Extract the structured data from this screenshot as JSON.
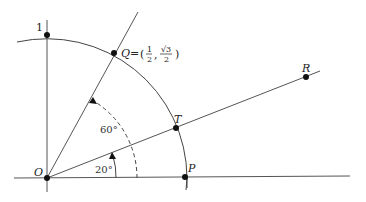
{
  "diagram": {
    "type": "unit-circle-rotation",
    "points": {
      "O": {
        "label": "O"
      },
      "P": {
        "label": "P"
      },
      "Q": {
        "label": "Q",
        "coord_prefix": "Q = (",
        "x_num": "1",
        "x_den": "2",
        "y_num": "√3",
        "y_den": "2",
        "coord_suffix": ")"
      },
      "T": {
        "label": "T"
      },
      "R": {
        "label": "R"
      },
      "one": {
        "label": "1"
      }
    },
    "angles": {
      "small": {
        "label": "20°"
      },
      "large": {
        "label": "60°"
      }
    },
    "colors": {
      "line": "#555555",
      "point": "#111111",
      "text": "#222222"
    }
  }
}
